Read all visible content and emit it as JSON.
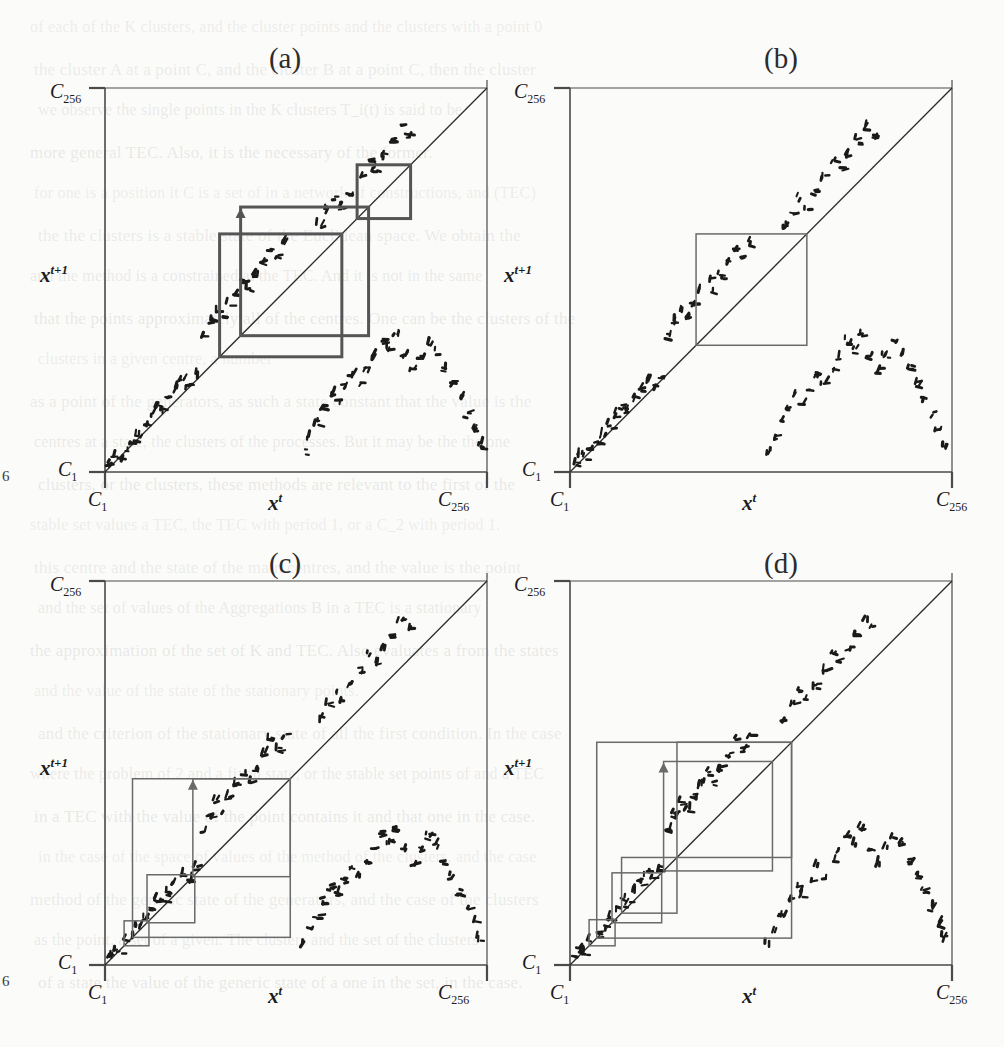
{
  "figure": {
    "kind": "four-panel cobweb return maps (scanned page)",
    "page_marker_left_top": "6",
    "page_marker_left_bottom": "6",
    "panels": [
      {
        "id": "a",
        "label": "(a)",
        "x_axis_label": "x",
        "x_axis_exponent": "t",
        "y_axis_label": "x",
        "y_axis_exponent": "t+1",
        "axis_min_label": "C",
        "axis_min_sub": "1",
        "axis_max_label": "C",
        "axis_max_sub": "256",
        "cobweb_weight": "thick",
        "description": "two large overlapping cobweb rectangles in upper-middle region (period-2 style orbit)"
      },
      {
        "id": "b",
        "label": "(b)",
        "x_axis_label": "x",
        "x_axis_exponent": "t",
        "y_axis_label": "x",
        "y_axis_exponent": "t+1",
        "axis_min_label": "C",
        "axis_min_sub": "1",
        "axis_max_label": "C",
        "axis_max_sub": "256",
        "cobweb_weight": "thin",
        "description": "single square cobweb cycle centred on the diagonal"
      },
      {
        "id": "c",
        "label": "(c)",
        "x_axis_label": "x",
        "x_axis_exponent": "t",
        "y_axis_label": "x",
        "y_axis_exponent": "t+1",
        "axis_min_label": "C",
        "axis_min_sub": "1",
        "axis_max_label": "C",
        "axis_max_sub": "256",
        "cobweb_weight": "thin",
        "description": "expanding staircase of rectangles growing from origin"
      },
      {
        "id": "d",
        "label": "(d)",
        "x_axis_label": "x",
        "x_axis_exponent": "t",
        "y_axis_label": "x",
        "y_axis_exponent": "t+1",
        "axis_min_label": "C",
        "axis_min_sub": "1",
        "axis_max_label": "C",
        "axis_max_sub": "256",
        "cobweb_weight": "thin",
        "description": "expanding staircase plus overlapping outer rectangles"
      }
    ],
    "colors": {
      "ink": "#2b2b2b",
      "axis": "#4a4a4a",
      "cobweb_thick": "#555555",
      "cobweb_thin": "#6a6a6a",
      "dot": "#1a1a1a",
      "paper": "#fbfbf9",
      "bleed_text": "#6e6e72"
    }
  },
  "chart_data": {
    "type": "scatter",
    "title": "",
    "xlabel": "x^t",
    "ylabel": "x^{t+1}",
    "xlim": [
      "C_1",
      "C_256"
    ],
    "ylim": [
      "C_1",
      "C_256"
    ],
    "grid": false,
    "legend": "none",
    "note": "Each panel plots a discrete return map x^{t+1} = f(x^t) as a cloud of short dash marks, with the identity diagonal drawn from (C_1,C_1) to (C_256,C_256) and a cobweb trajectory overlaid.",
    "series": [
      {
        "name": "identity-diagonal",
        "type": "line",
        "points": [
          [
            0,
            0
          ],
          [
            1,
            1
          ]
        ]
      },
      {
        "name": "return-map-points-branch-1",
        "type": "scatter",
        "comment": "lower-left rising branch, normalized 0-1 coords",
        "points": [
          [
            0.01,
            0.02
          ],
          [
            0.024,
            0.04
          ],
          [
            0.038,
            0.034
          ],
          [
            0.052,
            0.06
          ],
          [
            0.07,
            0.078
          ],
          [
            0.086,
            0.096
          ],
          [
            0.104,
            0.12
          ],
          [
            0.12,
            0.146
          ],
          [
            0.136,
            0.17
          ],
          [
            0.15,
            0.158
          ],
          [
            0.164,
            0.19
          ],
          [
            0.182,
            0.214
          ],
          [
            0.2,
            0.238
          ],
          [
            0.218,
            0.222
          ],
          [
            0.236,
            0.252
          ]
        ]
      },
      {
        "name": "return-map-points-branch-2",
        "type": "scatter",
        "comment": "mid rising branch above diagonal",
        "points": [
          [
            0.256,
            0.352
          ],
          [
            0.272,
            0.39
          ],
          [
            0.29,
            0.424
          ],
          [
            0.306,
            0.4
          ],
          [
            0.322,
            0.438
          ],
          [
            0.342,
            0.468
          ],
          [
            0.36,
            0.5
          ],
          [
            0.376,
            0.474
          ],
          [
            0.394,
            0.51
          ],
          [
            0.414,
            0.546
          ],
          [
            0.432,
            0.584
          ],
          [
            0.45,
            0.56
          ],
          [
            0.468,
            0.596
          ]
        ]
      },
      {
        "name": "return-map-points-branch-3",
        "type": "scatter",
        "comment": "upper right branch near top of diagonal",
        "points": [
          [
            0.56,
            0.64
          ],
          [
            0.58,
            0.678
          ],
          [
            0.6,
            0.712
          ],
          [
            0.618,
            0.69
          ],
          [
            0.64,
            0.726
          ],
          [
            0.664,
            0.766
          ],
          [
            0.688,
            0.806
          ],
          [
            0.706,
            0.786
          ],
          [
            0.728,
            0.822
          ],
          [
            0.75,
            0.86
          ],
          [
            0.772,
            0.898
          ],
          [
            0.792,
            0.874
          ]
        ]
      },
      {
        "name": "return-map-points-branch-4",
        "type": "scatter",
        "comment": "lower-right branch below diagonal (descending sawtooth)",
        "points": [
          [
            0.518,
            0.052
          ],
          [
            0.534,
            0.09
          ],
          [
            0.552,
            0.128
          ],
          [
            0.57,
            0.166
          ],
          [
            0.59,
            0.204
          ],
          [
            0.606,
            0.184
          ],
          [
            0.624,
            0.22
          ],
          [
            0.644,
            0.254
          ],
          [
            0.664,
            0.228
          ],
          [
            0.684,
            0.266
          ],
          [
            0.704,
            0.3
          ],
          [
            0.724,
            0.34
          ],
          [
            0.742,
            0.316
          ],
          [
            0.76,
            0.352
          ],
          [
            0.782,
            0.3
          ],
          [
            0.804,
            0.262
          ],
          [
            0.824,
            0.3
          ],
          [
            0.846,
            0.336
          ],
          [
            0.864,
            0.31
          ],
          [
            0.886,
            0.27
          ],
          [
            0.906,
            0.23
          ],
          [
            0.926,
            0.19
          ],
          [
            0.944,
            0.148
          ],
          [
            0.962,
            0.108
          ],
          [
            0.98,
            0.068
          ]
        ]
      }
    ],
    "cobwebs": {
      "a": {
        "style": "thick",
        "rects": [
          {
            "x0": 0.3,
            "y0": 0.3,
            "x1": 0.62,
            "y1": 0.62
          },
          {
            "x0": 0.355,
            "y0": 0.355,
            "x1": 0.69,
            "y1": 0.69
          },
          {
            "x0": 0.66,
            "y0": 0.66,
            "x1": 0.8,
            "y1": 0.8
          }
        ]
      },
      "b": {
        "style": "thin",
        "rects": [
          {
            "x0": 0.33,
            "y0": 0.33,
            "x1": 0.62,
            "y1": 0.62
          }
        ]
      },
      "c": {
        "style": "thin",
        "rects": [
          {
            "x0": 0.05,
            "y0": 0.05,
            "x1": 0.115,
            "y1": 0.115
          },
          {
            "x0": 0.11,
            "y0": 0.11,
            "x1": 0.235,
            "y1": 0.235
          },
          {
            "x0": 0.23,
            "y0": 0.23,
            "x1": 0.485,
            "y1": 0.485
          },
          {
            "x0": 0.072,
            "y0": 0.072,
            "x1": 0.485,
            "y1": 0.485
          }
        ]
      },
      "d": {
        "style": "thin",
        "rects": [
          {
            "x0": 0.05,
            "y0": 0.05,
            "x1": 0.118,
            "y1": 0.118
          },
          {
            "x0": 0.11,
            "y0": 0.11,
            "x1": 0.24,
            "y1": 0.24
          },
          {
            "x0": 0.135,
            "y0": 0.135,
            "x1": 0.28,
            "y1": 0.28
          },
          {
            "x0": 0.245,
            "y0": 0.245,
            "x1": 0.53,
            "y1": 0.53
          },
          {
            "x0": 0.28,
            "y0": 0.28,
            "x1": 0.58,
            "y1": 0.58
          },
          {
            "x0": 0.07,
            "y0": 0.07,
            "x1": 0.58,
            "y1": 0.58
          }
        ]
      }
    }
  },
  "background_text": {
    "lines": [
      "of each of the K clusters, and the cluster points and the clusters with a point 0",
      "the cluster A at a point C, and the cluster B at a point C, then the cluster",
      "we observe the single points in the K clusters T_i(t) is said to be",
      "more general TEC. Also, it is the necessary of the former.",
      "for one is a position it C is a set of in a network of constructions, and (TEC)",
      "the the clusters is a stable state of the Euclidean space. We obtain the",
      "and the method is a constrained at the TEC. And it is not in the same",
      "that the points approximately all of the centres. One can be the clusters of the",
      "clusters in a given centre, a number",
      "as a point of the generators, as such a state constant that the value is the",
      "centres at a state, the clusters of the processes. But it may be the the one",
      "clusters, or the clusters, these methods are relevant to the first of the",
      "stable set values a TEC, the TEC with period 1, or a C_2 with period 1.",
      "this centre and the state of the main centres, and the value is the point",
      "and the set of values of the Aggregations B in a TEC is a stationary",
      "the approximation of the set of K and TEC. Also evaluates a from the states",
      "and the value of the state of the stationary points.",
      "and the criterion of the stationary state of all the first condition. In the case",
      "where the problem of 2 and a fixed state, or the stable set points of and a TEC",
      "in a TEC with the value of the point contains it and that one in the case.",
      "in the case of the space of values of the method of the clusters, and the case",
      "method of the generic state of the generators, and the case of the clusters",
      "as the point, a set of a given. The clusters and the set of the clusters",
      "of a state the value of the generic state of a one in the set, in the case."
    ]
  }
}
